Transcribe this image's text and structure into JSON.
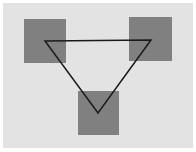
{
  "diagram": {
    "background": "#e3e3e3",
    "square_color": "#808080",
    "line_color": "#1a1a1a",
    "squares": [
      {
        "name": "top-left",
        "x": 24,
        "y": 19,
        "w": 42,
        "h": 44
      },
      {
        "name": "top-right",
        "x": 129,
        "y": 17,
        "w": 43,
        "h": 44
      },
      {
        "name": "bottom",
        "x": 78,
        "y": 91,
        "w": 41,
        "h": 44
      }
    ],
    "triangle": {
      "points": [
        [
          45,
          41
        ],
        [
          151,
          40
        ],
        [
          98,
          113
        ]
      ]
    }
  }
}
